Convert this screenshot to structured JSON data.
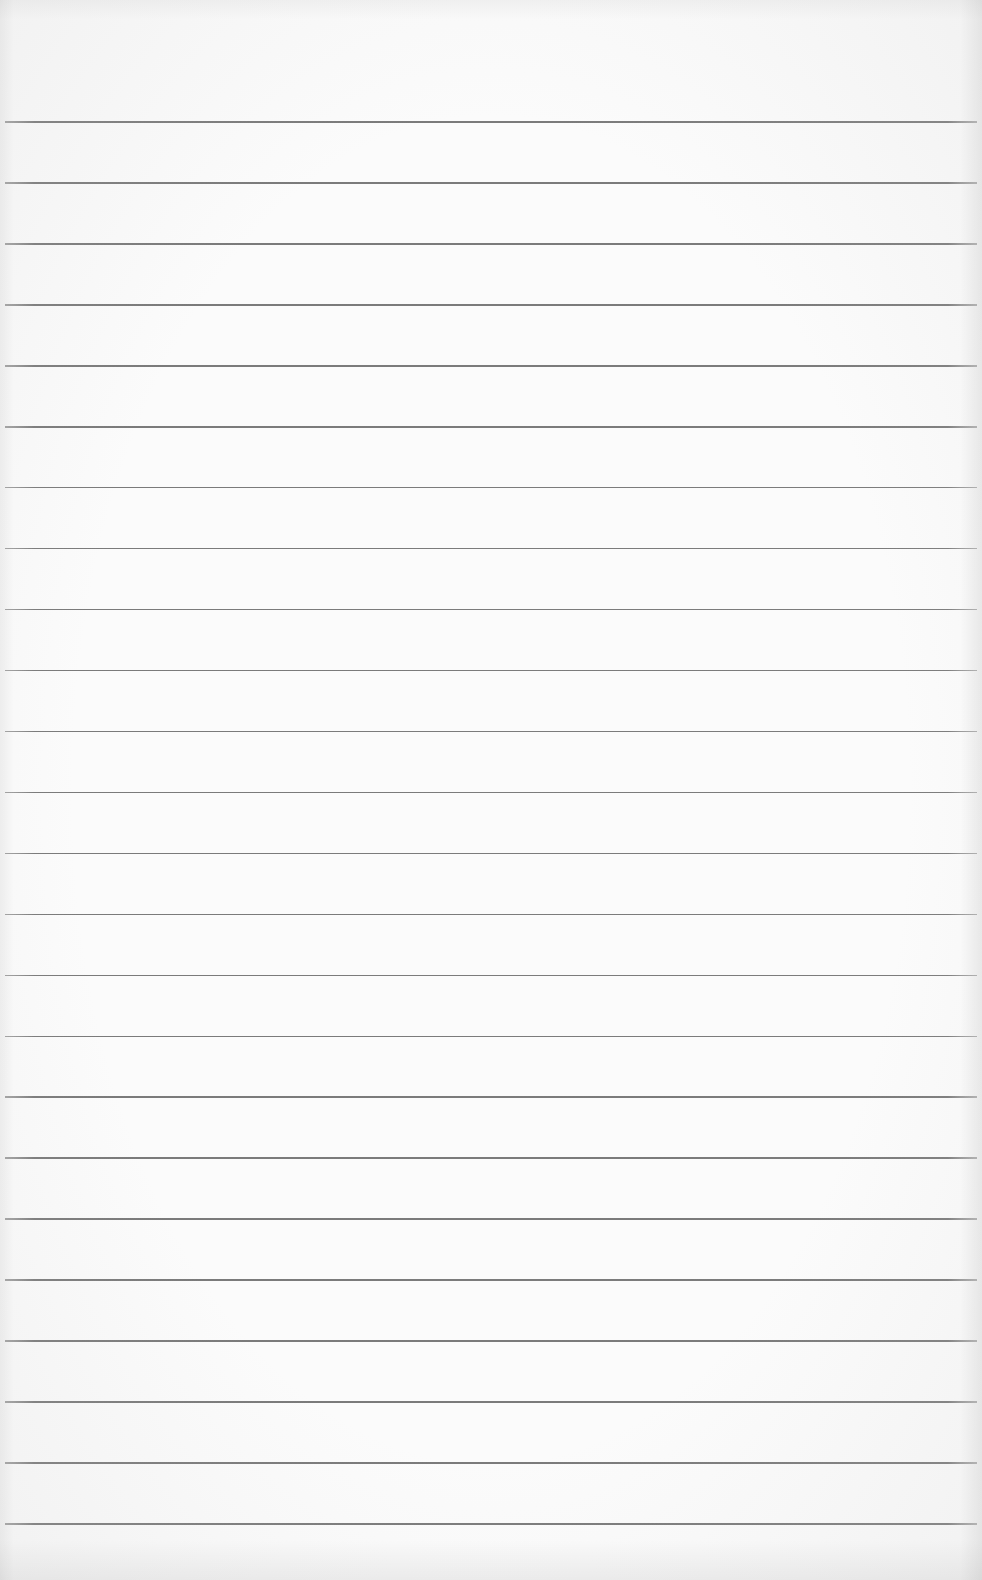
{
  "document": {
    "type": "ruled-notebook-paper",
    "text_content": [],
    "paper_color": "#fbfbfb",
    "rule_color": "#7a7a7a",
    "rules": {
      "count": 24,
      "first_y": 122,
      "spacing": 60.95,
      "x_start": 5,
      "x_end": 977
    }
  }
}
